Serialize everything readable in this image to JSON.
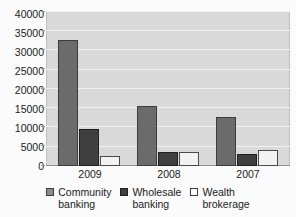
{
  "chart_data": {
    "type": "bar",
    "title": "",
    "xlabel": "",
    "ylabel": "",
    "categories": [
      "2009",
      "2008",
      "2007"
    ],
    "series": [
      {
        "name": "Community banking",
        "color": "#6b6b6b",
        "values": [
          32500,
          15500,
          12700
        ]
      },
      {
        "name": "Wholesale banking",
        "color": "#3f3f3f",
        "values": [
          9500,
          3700,
          3200
        ]
      },
      {
        "name": "Wealth brokerage",
        "color": "#f2f2f2",
        "values": [
          2700,
          3700,
          4100
        ]
      }
    ],
    "ylim": [
      0,
      40000
    ],
    "ytick_step": 5000,
    "yticks": [
      40000,
      35000,
      30000,
      25000,
      20000,
      15000,
      10000,
      5000,
      0
    ],
    "ytick_labels": [
      "40000",
      "35000",
      "30000",
      "25000",
      "20000",
      "15000",
      "10000",
      "5000",
      "0"
    ],
    "grid": true,
    "legend_position": "bottom",
    "plot_background": "#d9d9d9"
  },
  "legend": {
    "items": [
      {
        "line1": "Community",
        "line2": "banking",
        "swatch": "legend-swatch-community"
      },
      {
        "line1": "Wholesale",
        "line2": "banking",
        "swatch": "legend-swatch-wholesale"
      },
      {
        "line1": "Wealth",
        "line2": "brokerage",
        "swatch": "legend-swatch-wealth"
      }
    ]
  }
}
